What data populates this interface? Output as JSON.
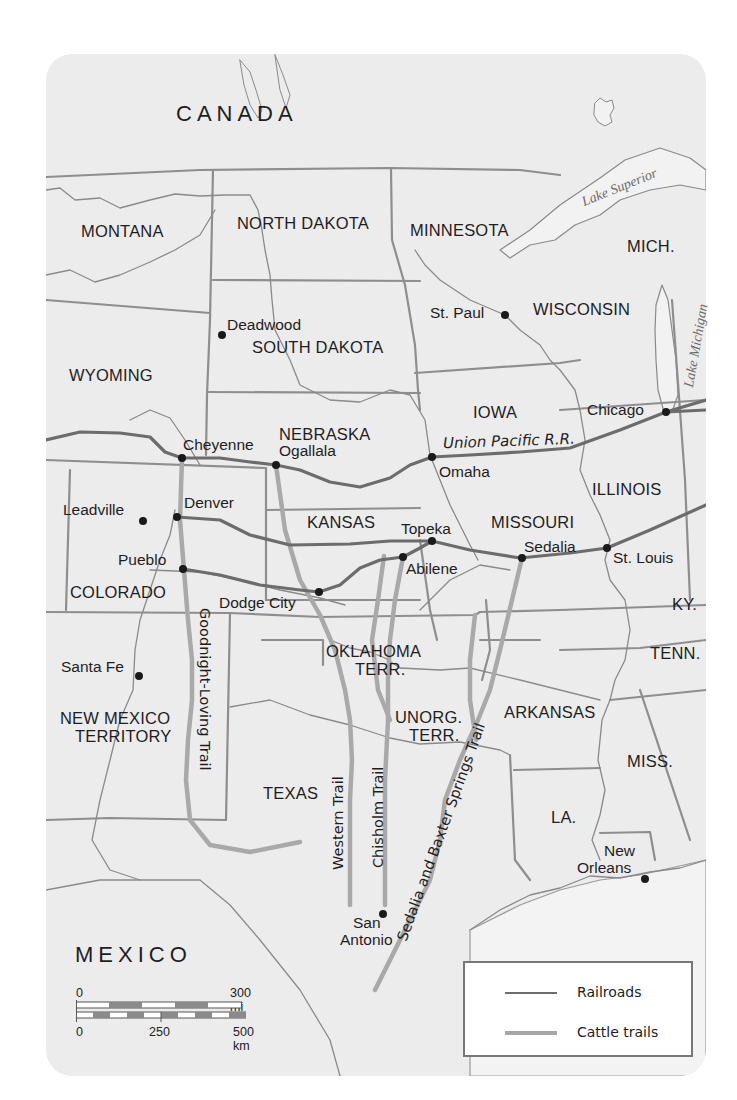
{
  "map": {
    "countries": [
      {
        "id": "canada",
        "label": "CANADA",
        "x": 176,
        "y": 103
      },
      {
        "id": "mexico",
        "label": "MEXICO",
        "x": 75,
        "y": 944
      }
    ],
    "states": [
      {
        "id": "montana",
        "label": "MONTANA",
        "x": 81,
        "y": 223
      },
      {
        "id": "north-dakota",
        "label": "NORTH DAKOTA",
        "x": 237,
        "y": 215
      },
      {
        "id": "minnesota",
        "label": "MINNESOTA",
        "x": 410,
        "y": 222
      },
      {
        "id": "mich",
        "label": "MICH.",
        "x": 627,
        "y": 238
      },
      {
        "id": "wisconsin",
        "label": "WISCONSIN",
        "x": 533,
        "y": 301
      },
      {
        "id": "south-dakota",
        "label": "SOUTH DAKOTA",
        "x": 252,
        "y": 339
      },
      {
        "id": "wyoming",
        "label": "WYOMING",
        "x": 69,
        "y": 367
      },
      {
        "id": "iowa",
        "label": "IOWA",
        "x": 473,
        "y": 404
      },
      {
        "id": "nebraska",
        "label": "NEBRASKA",
        "x": 279,
        "y": 426
      },
      {
        "id": "illinois",
        "label": "ILLINOIS",
        "x": 592,
        "y": 481
      },
      {
        "id": "kansas",
        "label": "KANSAS",
        "x": 307,
        "y": 514
      },
      {
        "id": "missouri",
        "label": "MISSOURI",
        "x": 491,
        "y": 514
      },
      {
        "id": "colorado",
        "label": "COLORADO",
        "x": 70,
        "y": 584
      },
      {
        "id": "ky",
        "label": "KY.",
        "x": 672,
        "y": 596
      },
      {
        "id": "oklahoma",
        "label": "OKLAHOMA",
        "line2": "TERR.",
        "x": 326,
        "y": 643
      },
      {
        "id": "tenn",
        "label": "TENN.",
        "x": 650,
        "y": 645
      },
      {
        "id": "new-mexico",
        "label": "NEW MEXICO",
        "line2": "TERRITORY",
        "x": 60,
        "y": 717
      },
      {
        "id": "unorg",
        "label": "UNORG.",
        "line2": "TERR.",
        "x": 395,
        "y": 716
      },
      {
        "id": "arkansas",
        "label": "ARKANSAS",
        "x": 504,
        "y": 704
      },
      {
        "id": "miss",
        "label": "MISS.",
        "x": 627,
        "y": 753
      },
      {
        "id": "texas",
        "label": "TEXAS",
        "x": 263,
        "y": 785
      },
      {
        "id": "la",
        "label": "LA.",
        "x": 551,
        "y": 809
      }
    ],
    "cities": [
      {
        "id": "deadwood",
        "label": "Deadwood",
        "x": 222,
        "y": 335,
        "lx": 227,
        "ly": 317
      },
      {
        "id": "st-paul",
        "label": "St. Paul",
        "x": 505,
        "y": 315,
        "lx": 430,
        "ly": 305
      },
      {
        "id": "chicago",
        "label": "Chicago",
        "x": 666,
        "y": 412,
        "lx": 587,
        "ly": 402
      },
      {
        "id": "cheyenne",
        "label": "Cheyenne",
        "x": 182,
        "y": 458,
        "lx": 183,
        "ly": 437
      },
      {
        "id": "ogallala",
        "label": "Ogallala",
        "x": 276,
        "y": 465,
        "lx": 279,
        "ly": 443
      },
      {
        "id": "omaha",
        "label": "Omaha",
        "x": 432,
        "y": 457,
        "lx": 439,
        "ly": 464
      },
      {
        "id": "denver",
        "label": "Denver",
        "x": 177,
        "y": 517,
        "lx": 184,
        "ly": 495
      },
      {
        "id": "leadville",
        "label": "Leadville",
        "x": 143,
        "y": 521,
        "lx": 63,
        "ly": 502
      },
      {
        "id": "topeka",
        "label": "Topeka",
        "x": 432,
        "y": 541,
        "lx": 401,
        "ly": 521
      },
      {
        "id": "abilene",
        "label": "Abilene",
        "x": 403,
        "y": 557,
        "lx": 406,
        "ly": 561
      },
      {
        "id": "sedalia",
        "label": "Sedalia",
        "x": 522,
        "y": 558,
        "lx": 524,
        "ly": 539
      },
      {
        "id": "st-louis",
        "label": "St. Louis",
        "x": 607,
        "y": 548,
        "lx": 613,
        "ly": 550
      },
      {
        "id": "pueblo",
        "label": "Pueblo",
        "x": 183,
        "y": 569,
        "lx": 118,
        "ly": 552
      },
      {
        "id": "dodge-city",
        "label": "Dodge City",
        "x": 319,
        "y": 592,
        "lx": 219,
        "ly": 595
      },
      {
        "id": "santa-fe",
        "label": "Santa Fe",
        "x": 139,
        "y": 676,
        "lx": 61,
        "ly": 659
      },
      {
        "id": "san-antonio",
        "label": "San",
        "line2": "Antonio",
        "x": 383,
        "y": 914,
        "lx": 353,
        "ly": 915
      },
      {
        "id": "new-orleans",
        "label": "New",
        "line2": "Orleans",
        "x": 645,
        "y": 879,
        "lx": 577,
        "ly": 843
      }
    ],
    "lakes": [
      {
        "id": "lake-superior",
        "label": "Lake Superior",
        "x": 580,
        "y": 196,
        "rotate": -22
      },
      {
        "id": "lake-michigan",
        "label": "Lake Michigan",
        "x": 682,
        "y": 380,
        "rotate": -80
      }
    ],
    "railroad_label": {
      "label": "Union Pacific R.R.",
      "x": 443,
      "y": 443,
      "rotate": -2
    },
    "trails": [
      {
        "id": "goodnight-loving",
        "label": "Goodnight-Loving Trail",
        "x": 209,
        "y": 608,
        "rotate": 90
      },
      {
        "id": "western",
        "label": "Western Trail",
        "x": 336,
        "y": 868,
        "rotate": -90
      },
      {
        "id": "chisholm",
        "label": "Chisholm Trail",
        "x": 376,
        "y": 868,
        "rotate": -90
      },
      {
        "id": "sedalia-baxter",
        "label": "Sedalia and Baxter Springs Trail",
        "x": 398,
        "y": 935,
        "rotate": -70
      }
    ],
    "colors": {
      "land": "#ececec",
      "border": "#8a8a8a",
      "river": "#9a9a9a",
      "railroad": "#6e6e6e",
      "cattle_trail": "#a6a6a6"
    }
  },
  "scale_bar": {
    "miles": {
      "zero": "0",
      "max": "300 mi"
    },
    "km": {
      "zero": "0",
      "mid": "250",
      "max": "500 km"
    }
  },
  "legend": {
    "items": [
      {
        "label": "Railroads",
        "color": "#6e6e6e"
      },
      {
        "label": "Cattle trails",
        "color": "#a6a6a6"
      }
    ]
  }
}
